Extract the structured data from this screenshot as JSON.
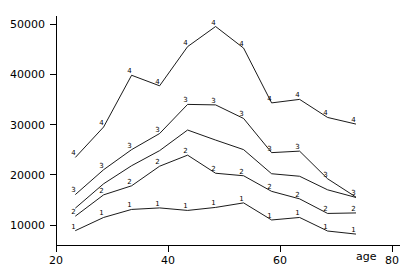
{
  "chart_data": {
    "type": "line",
    "title": "",
    "subtitle": "",
    "xlabel": "age",
    "ylabel": "",
    "xlim": [
      20,
      80
    ],
    "ylim": [
      7000,
      51500
    ],
    "grid": false,
    "legend": "none",
    "legend_entries": [],
    "annotations": [],
    "x_tick_labels": [
      "20",
      "40",
      "60",
      "80"
    ],
    "x_ticks": [
      20,
      40,
      60,
      80
    ],
    "y_tick_labels": [
      "10000",
      "20000",
      "30000",
      "40000",
      "50000"
    ],
    "y_ticks": [
      10000,
      20000,
      30000,
      40000,
      50000
    ],
    "x": [
      23.5,
      28.5,
      33.5,
      38.5,
      43.5,
      48.5,
      53.5,
      58.5,
      63.5,
      68.5,
      73.5
    ],
    "point_marker_style": "series-number-digit",
    "series": [
      {
        "name": "1",
        "marker_label": "1",
        "values": [
          8900,
          11500,
          13100,
          13400,
          12900,
          13500,
          14400,
          11000,
          11500,
          8800,
          8200
        ]
      },
      {
        "name": "2",
        "marker_label": "2",
        "values": [
          11800,
          16000,
          17800,
          21700,
          23900,
          20300,
          19800,
          16700,
          15200,
          12300,
          12400
        ]
      },
      {
        "name": "unlabeled",
        "marker_label": "",
        "values": [
          13400,
          18200,
          21800,
          24800,
          28900,
          26900,
          25000,
          20200,
          19700,
          17000,
          15500
        ]
      },
      {
        "name": "3",
        "marker_label": "3",
        "values": [
          16100,
          21000,
          25000,
          28200,
          34000,
          33900,
          31200,
          24400,
          24700,
          19200,
          15600
        ]
      },
      {
        "name": "4",
        "marker_label": "4",
        "values": [
          23500,
          29500,
          39800,
          37700,
          45500,
          49500,
          45200,
          34300,
          35000,
          31400,
          30100
        ]
      }
    ]
  },
  "axes": {
    "x_axis_name": "age",
    "y_axis_name": ""
  }
}
